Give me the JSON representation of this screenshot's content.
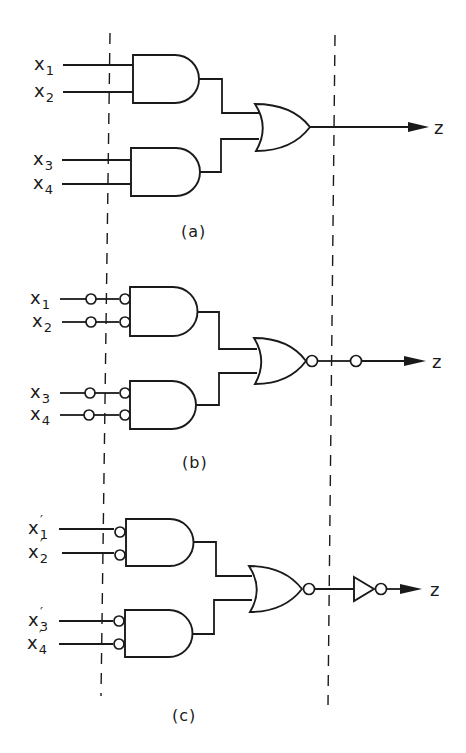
{
  "figure": {
    "boundary_lines": {
      "style": "dashed",
      "count": 2
    },
    "panels": [
      {
        "caption": "(a)",
        "inputs": [
          {
            "var": "x",
            "sub": "1",
            "prime": ""
          },
          {
            "var": "x",
            "sub": "2",
            "prime": ""
          },
          {
            "var": "x",
            "sub": "3",
            "prime": ""
          },
          {
            "var": "x",
            "sub": "4",
            "prime": ""
          }
        ],
        "first_level": "AND",
        "second_level": "OR",
        "output": "z"
      },
      {
        "caption": "(b)",
        "inputs": [
          {
            "var": "x",
            "sub": "1",
            "prime": ""
          },
          {
            "var": "x",
            "sub": "2",
            "prime": ""
          },
          {
            "var": "x",
            "sub": "3",
            "prime": ""
          },
          {
            "var": "x",
            "sub": "4",
            "prime": ""
          }
        ],
        "first_level": "AND with double-inverted inputs",
        "second_level": "NOR followed by inversion bubble",
        "output": "z"
      },
      {
        "caption": "(c)",
        "inputs": [
          {
            "var": "x",
            "sub": "1",
            "prime": "′"
          },
          {
            "var": "x",
            "sub": "2",
            "prime": "′"
          },
          {
            "var": "x",
            "sub": "3",
            "prime": "′"
          },
          {
            "var": "x",
            "sub": "4",
            "prime": "′"
          }
        ],
        "first_level": "AND with inverted inputs",
        "second_level": "NOR followed by inverter (NOT gate)",
        "output": "z"
      }
    ]
  }
}
